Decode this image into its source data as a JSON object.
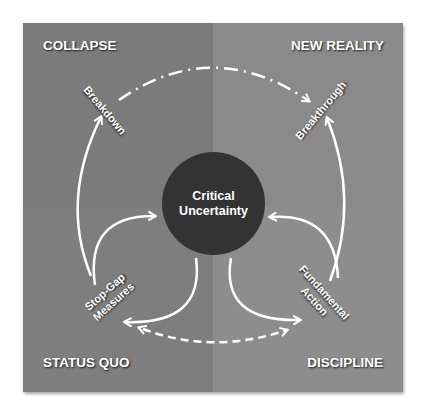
{
  "colors": {
    "quadrant_left": "#7b7b7b",
    "quadrant_right": "#8a8a8a",
    "circle": "#333333",
    "text": "#ffffff",
    "arrow": "#ffffff"
  },
  "quadrants": {
    "top_left": {
      "label": "COLLAPSE"
    },
    "top_right": {
      "label": "NEW REALITY"
    },
    "bottom_left": {
      "label": "STATUS QUO"
    },
    "bottom_right": {
      "label": "DISCIPLINE"
    }
  },
  "center": {
    "line1": "Critical",
    "line2": "Uncertainty"
  },
  "nodes": {
    "breakdown": {
      "label": "Breakdown"
    },
    "breakthrough": {
      "label": "Breakthrough"
    },
    "stop_gap": {
      "line1": "Stop-Gap",
      "line2": "Measures"
    },
    "fundamental": {
      "line1": "Fundamental",
      "line2": "Action"
    }
  },
  "arrows": [
    {
      "from": "Breakdown",
      "to": "Breakthrough",
      "style": "dash-dot"
    },
    {
      "from": "Stop-Gap Measures",
      "to": "Breakdown",
      "style": "solid"
    },
    {
      "from": "Stop-Gap Measures",
      "to": "Critical Uncertainty",
      "style": "solid"
    },
    {
      "from": "Critical Uncertainty",
      "to": "Stop-Gap Measures",
      "style": "solid"
    },
    {
      "from": "Fundamental Action",
      "to": "Breakthrough",
      "style": "solid"
    },
    {
      "from": "Fundamental Action",
      "to": "Critical Uncertainty",
      "style": "solid"
    },
    {
      "from": "Critical Uncertainty",
      "to": "Fundamental Action",
      "style": "solid"
    },
    {
      "from": "Stop-Gap Measures",
      "to": "Fundamental Action",
      "style": "dashed-bidirectional"
    }
  ]
}
